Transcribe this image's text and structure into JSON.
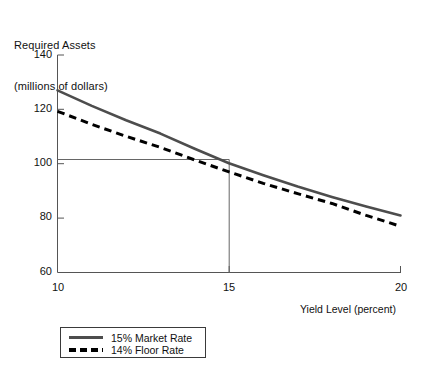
{
  "chart_data": {
    "type": "line",
    "title": "Required Assets (millions of dollars)",
    "title_line1": "Required Assets",
    "title_line2": "(millions of dollars)",
    "xlabel": "Yield Level (percent)",
    "ylabel": "Required Assets (millions of dollars)",
    "xlim": [
      10,
      20
    ],
    "ylim": [
      60,
      140
    ],
    "xticks": [
      "10",
      "15",
      "20"
    ],
    "xtick_values": [
      10,
      15,
      20
    ],
    "yticks": [
      "60",
      "80",
      "100",
      "120",
      "140"
    ],
    "ytick_values": [
      60,
      80,
      100,
      120,
      140
    ],
    "grid": false,
    "legend_position": "below-left",
    "x": [
      10,
      11,
      12,
      13,
      14,
      15,
      16,
      17,
      18,
      19,
      20
    ],
    "series": [
      {
        "name": "15% Market Rate",
        "style": "solid",
        "color": "#4d4d4d",
        "values": [
          127.0,
          121.3,
          116.0,
          111.1,
          105.5,
          100.2,
          95.8,
          91.6,
          87.8,
          84.3,
          81.0
        ]
      },
      {
        "name": "14% Floor Rate",
        "style": "dashed",
        "color": "#000000",
        "values": [
          119.3,
          114.5,
          110.1,
          106.0,
          101.4,
          97.0,
          92.8,
          89.0,
          85.4,
          81.0,
          77.0
        ]
      }
    ],
    "annotations": [
      {
        "name": "reference-lines",
        "description": "Guide lines at y = 100 and x = 15 meeting on the 15% Market Rate curve",
        "y_value": 100,
        "x_value": 15
      }
    ]
  },
  "legend": {
    "items": [
      {
        "label": "15% Market Rate",
        "style": "solid"
      },
      {
        "label": "14% Floor Rate",
        "style": "dashed"
      }
    ]
  }
}
